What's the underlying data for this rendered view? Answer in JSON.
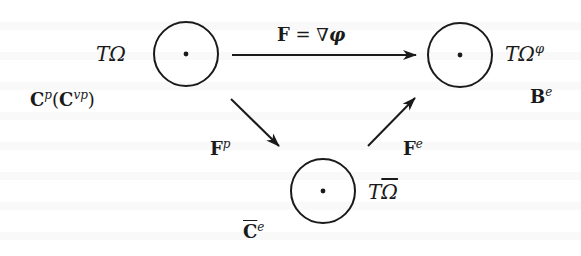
{
  "diagram": {
    "type": "commutative-diagram",
    "nodes": {
      "reference": {
        "label": "TΩ",
        "label_base": "T",
        "label_symbol": "Ω",
        "tensor_label_base": "C",
        "tensor_label_sup": "p",
        "tensor_label_paren_base": "C",
        "tensor_label_paren_sup": "vp",
        "tensor_label": "Cᵖ(Cᵛᵖ)"
      },
      "current": {
        "label": "TΩᵠ",
        "label_base": "T",
        "label_symbol": "Ω",
        "label_sup": "φ",
        "tensor_label_base": "B",
        "tensor_label_sup": "e",
        "tensor_label": "Bᵉ"
      },
      "intermediate": {
        "label": "TΩ̄",
        "label_base": "T",
        "label_symbol": "Ω",
        "tensor_label_base": "C",
        "tensor_label_sup": "e",
        "tensor_label": "C̄ᵉ"
      }
    },
    "arrows": {
      "total": {
        "label_lhs": "F",
        "label_eq": " = ∇",
        "label_rhs": "φ",
        "label": "F = ∇φ",
        "from": "reference",
        "to": "current"
      },
      "plastic": {
        "label_base": "F",
        "label_sup": "p",
        "label": "Fᵖ",
        "from": "reference",
        "to": "intermediate"
      },
      "elastic": {
        "label_base": "F",
        "label_sup": "e",
        "label": "Fᵉ",
        "from": "intermediate",
        "to": "current"
      }
    },
    "colors": {
      "ink": "#1a1a1a",
      "background": "#ffffff"
    }
  }
}
